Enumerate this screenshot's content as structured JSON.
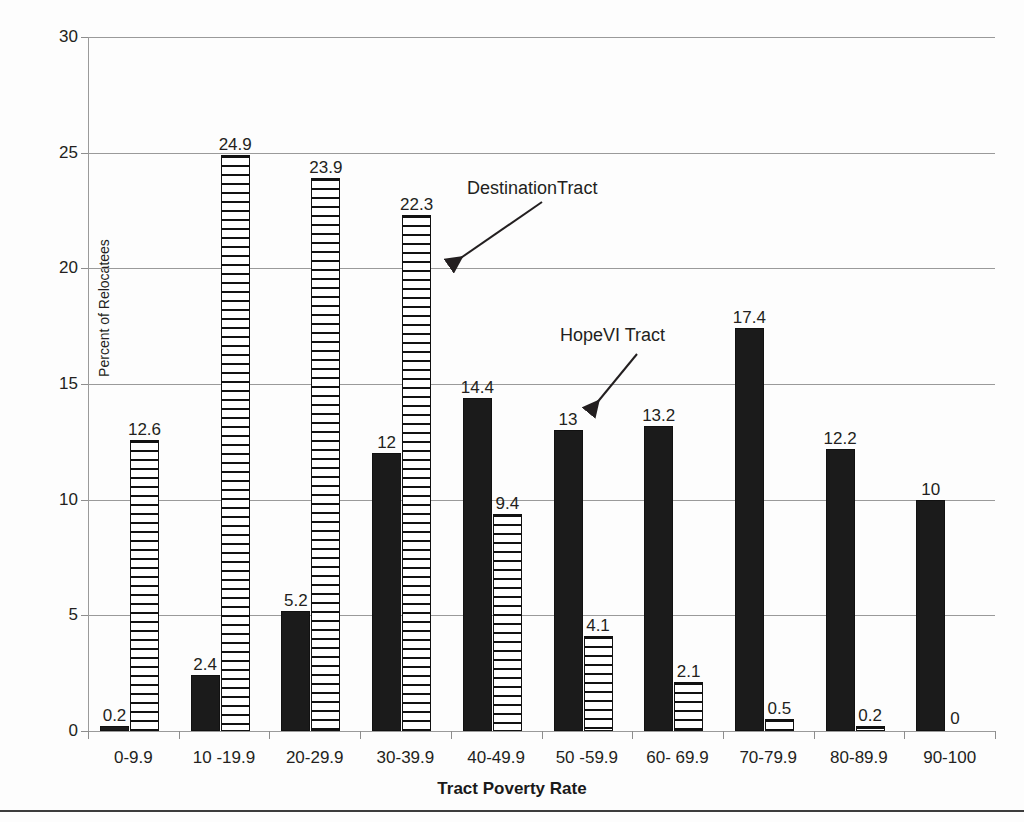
{
  "chart_data": {
    "type": "bar",
    "title": "",
    "xlabel": "Tract Poverty Rate",
    "ylabel": "Percent of Relocatees",
    "ylim": [
      0,
      30
    ],
    "yticks": [
      0,
      5,
      10,
      15,
      20,
      25,
      30
    ],
    "ytick_labels": [
      "0",
      "5",
      "10",
      "15",
      "20",
      "25",
      "30"
    ],
    "grid": true,
    "legend": "annotations",
    "categories": [
      "0-9.9",
      "10 -19.9",
      "20-29.9",
      "30-39.9",
      "40-49.9",
      "50 -59.9",
      "60- 69.9",
      "70-79.9",
      "80-89.9",
      "90-100"
    ],
    "series": [
      {
        "name": "HopeVI Tract",
        "style": "solid-black",
        "values": [
          0.2,
          2.4,
          5.2,
          12,
          14.4,
          13,
          13.2,
          17.4,
          12.2,
          10
        ],
        "labels": [
          "0.2",
          "2.4",
          "5.2",
          "12",
          "14.4",
          "13",
          "13.2",
          "17.4",
          "12.2",
          "10"
        ]
      },
      {
        "name": "DestinationTract",
        "style": "horizontal-hatch",
        "values": [
          12.6,
          24.9,
          23.9,
          22.3,
          9.4,
          4.1,
          2.1,
          0.5,
          0.2,
          0
        ],
        "labels": [
          "12.6",
          "24.9",
          "23.9",
          "22.3",
          "9.4",
          "4.1",
          "2.1",
          "0.5",
          "0.2",
          "0"
        ]
      }
    ],
    "annotations": [
      {
        "text": "DestinationTract",
        "points_to": "hatched-bar-30-39.9"
      },
      {
        "text": "HopeVI Tract",
        "points_to": "solid-bar-50-59.9"
      }
    ]
  },
  "colors": {
    "series_solid": "#1b1b1b",
    "series_hatch_line": "#111111",
    "series_hatch_fill": "#ffffff",
    "gridline": "#9a9a9a",
    "text": "#231f20",
    "background": "#fdfdfd"
  }
}
